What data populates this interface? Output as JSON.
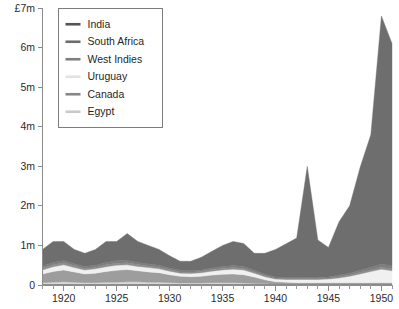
{
  "chart_data": {
    "type": "area",
    "stacked": true,
    "title": "",
    "subtitle": "",
    "xlabel": "",
    "ylabel": "",
    "y_axis_top_label": "£7m",
    "currency_prefix": "£",
    "xlim": [
      1918,
      1951
    ],
    "ylim": [
      0,
      7
    ],
    "grid": false,
    "legend_position": "top-left-inside",
    "y_tick_labels": [
      "0",
      "1m",
      "2m",
      "3m",
      "4m",
      "5m",
      "6m",
      "£7m"
    ],
    "y_tick_values": [
      0,
      1,
      2,
      3,
      4,
      5,
      6,
      7
    ],
    "x_tick_labels": [
      "1920",
      "1925",
      "1930",
      "1935",
      "1940",
      "1945",
      "1950"
    ],
    "x_tick_values": [
      1920,
      1925,
      1930,
      1935,
      1940,
      1945,
      1950
    ],
    "x_minor_tick_interval": 1,
    "x": [
      1918,
      1919,
      1920,
      1921,
      1922,
      1923,
      1924,
      1925,
      1926,
      1927,
      1928,
      1929,
      1930,
      1931,
      1932,
      1933,
      1934,
      1935,
      1936,
      1937,
      1938,
      1939,
      1940,
      1941,
      1942,
      1943,
      1944,
      1945,
      1946,
      1947,
      1948,
      1949,
      1950,
      1951
    ],
    "series": [
      {
        "name": "Egypt",
        "color": "#d9d9d9",
        "stack_order": 1,
        "values": [
          0.06,
          0.07,
          0.08,
          0.07,
          0.06,
          0.06,
          0.07,
          0.07,
          0.08,
          0.08,
          0.07,
          0.07,
          0.06,
          0.05,
          0.05,
          0.05,
          0.06,
          0.06,
          0.06,
          0.05,
          0.04,
          0.03,
          0.02,
          0.02,
          0.02,
          0.02,
          0.02,
          0.02,
          0.02,
          0.02,
          0.02,
          0.02,
          0.02,
          0.02
        ]
      },
      {
        "name": "Canada",
        "color": "#9d9d9d",
        "stack_order": 2,
        "values": [
          0.22,
          0.27,
          0.3,
          0.26,
          0.22,
          0.24,
          0.27,
          0.3,
          0.31,
          0.28,
          0.26,
          0.24,
          0.2,
          0.17,
          0.16,
          0.17,
          0.19,
          0.21,
          0.22,
          0.21,
          0.16,
          0.1,
          0.06,
          0.05,
          0.04,
          0.04,
          0.04,
          0.04,
          0.04,
          0.04,
          0.04,
          0.04,
          0.04,
          0.04
        ]
      },
      {
        "name": "Uruguay",
        "color": "#f0f0f0",
        "stack_order": 3,
        "values": [
          0.1,
          0.12,
          0.13,
          0.11,
          0.1,
          0.11,
          0.12,
          0.13,
          0.12,
          0.11,
          0.11,
          0.1,
          0.09,
          0.08,
          0.08,
          0.09,
          0.1,
          0.11,
          0.12,
          0.12,
          0.1,
          0.08,
          0.07,
          0.07,
          0.08,
          0.08,
          0.08,
          0.09,
          0.12,
          0.16,
          0.22,
          0.28,
          0.34,
          0.3
        ]
      },
      {
        "name": "West Indies",
        "color": "#8f8f8f",
        "stack_order": 4,
        "values": [
          0.05,
          0.05,
          0.05,
          0.05,
          0.04,
          0.04,
          0.05,
          0.05,
          0.05,
          0.05,
          0.04,
          0.04,
          0.04,
          0.03,
          0.03,
          0.03,
          0.04,
          0.04,
          0.04,
          0.04,
          0.03,
          0.03,
          0.02,
          0.02,
          0.02,
          0.02,
          0.02,
          0.02,
          0.03,
          0.03,
          0.04,
          0.04,
          0.05,
          0.05
        ]
      },
      {
        "name": "South Africa",
        "color": "#7e7e7e",
        "stack_order": 5,
        "values": [
          0.05,
          0.06,
          0.06,
          0.05,
          0.05,
          0.05,
          0.06,
          0.06,
          0.06,
          0.05,
          0.05,
          0.05,
          0.04,
          0.04,
          0.04,
          0.04,
          0.04,
          0.05,
          0.05,
          0.05,
          0.04,
          0.03,
          0.03,
          0.03,
          0.03,
          0.03,
          0.03,
          0.03,
          0.04,
          0.05,
          0.06,
          0.07,
          0.08,
          0.07
        ]
      },
      {
        "name": "India",
        "color": "#6e6e6e",
        "stack_order": 6,
        "values": [
          0.42,
          0.53,
          0.48,
          0.36,
          0.33,
          0.4,
          0.53,
          0.49,
          0.68,
          0.53,
          0.47,
          0.4,
          0.31,
          0.23,
          0.24,
          0.32,
          0.42,
          0.53,
          0.61,
          0.58,
          0.43,
          0.53,
          0.7,
          0.85,
          1.0,
          2.81,
          0.95,
          0.75,
          1.35,
          1.7,
          2.6,
          3.35,
          6.27,
          5.62
        ]
      }
    ],
    "totals": [
      0.9,
      1.1,
      1.1,
      0.9,
      0.8,
      0.9,
      1.1,
      1.1,
      1.3,
      1.1,
      1.0,
      0.9,
      0.74,
      0.6,
      0.6,
      0.7,
      0.85,
      1.0,
      1.1,
      1.05,
      0.8,
      0.8,
      0.9,
      1.04,
      1.19,
      3.0,
      1.14,
      0.95,
      1.6,
      2.0,
      2.98,
      3.8,
      6.8,
      6.1
    ]
  },
  "legend": {
    "items": [
      {
        "label": "India",
        "color": "#545454"
      },
      {
        "label": "South Africa",
        "color": "#6d6d6d"
      },
      {
        "label": "West Indies",
        "color": "#7f7f7f"
      },
      {
        "label": "Uruguay",
        "color": "#e2e2e2"
      },
      {
        "label": "Canada",
        "color": "#878787"
      },
      {
        "label": "Egypt",
        "color": "#c9c9c9"
      }
    ]
  },
  "caption": {
    "text": ""
  }
}
